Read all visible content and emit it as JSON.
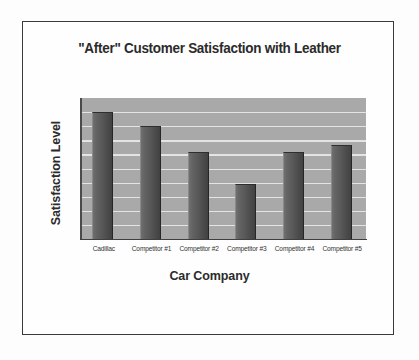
{
  "chart_data": {
    "type": "bar",
    "title": "\"After\" Customer Satisfaction with Leather",
    "xlabel": "Car Company",
    "ylabel": "Satisfaction Level",
    "categories": [
      "Cadillac",
      "Competitor #1",
      "Competitor #2",
      "Competitor #3",
      "Competitor #4",
      "Competitor #5"
    ],
    "values": [
      90,
      80,
      62,
      39,
      62,
      67
    ],
    "ylim": [
      0,
      100
    ],
    "y_tick_labels": [],
    "grid": "horizontal",
    "gridline_count": 10,
    "legend": "none",
    "series": [
      {
        "name": "Satisfaction Level",
        "values": [
          90,
          80,
          62,
          39,
          62,
          67
        ]
      }
    ],
    "bar_color": "#555555",
    "plot_background": "#a9a9a9",
    "gridline_color": "#e9e9e9",
    "axis_color": "#3f3f3f",
    "text_color": "#2b2b2b",
    "frame_color": "#3a3a3a",
    "page_background": "#fdfdfd"
  },
  "figure": {
    "title": "\"After\" Customer Satisfaction with Leather",
    "x_axis_title": "Car Company",
    "y_axis_title": "Satisfaction Level"
  }
}
